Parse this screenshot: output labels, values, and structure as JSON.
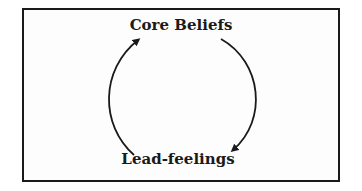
{
  "diagram": {
    "type": "cycle",
    "nodes": [
      {
        "id": "core",
        "label": "Core Beliefs"
      },
      {
        "id": "lead",
        "label": "Lead-feelings"
      }
    ],
    "edges": [
      {
        "from": "core",
        "to": "lead",
        "side": "right"
      },
      {
        "from": "lead",
        "to": "core",
        "side": "left"
      }
    ],
    "colors": {
      "stroke": "#1a1a1a",
      "background": "#ffffff"
    }
  }
}
